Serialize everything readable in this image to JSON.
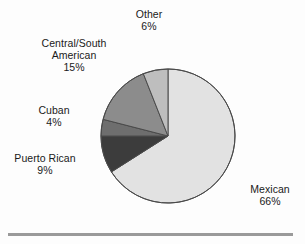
{
  "chart_data": {
    "type": "pie",
    "title": "",
    "subtitle": "",
    "xlabel": "",
    "ylabel": "",
    "legend_position": "none",
    "grid": false,
    "units": "percent",
    "start_angle_deg": 0,
    "direction": "clockwise",
    "categories": [
      "Mexican",
      "Puerto Rican",
      "Cuban",
      "Central/South American",
      "Other"
    ],
    "values": [
      66,
      9,
      4,
      15,
      6
    ],
    "slices": [
      {
        "label": "Mexican",
        "label_line1": "Mexican",
        "value": 66,
        "value_text": "66%",
        "color": "#e2e2e2",
        "label_position": "right"
      },
      {
        "label": "Puerto Rican",
        "label_line1": "Puerto Rican",
        "value": 9,
        "value_text": "9%",
        "color": "#3c3c3c",
        "label_position": "left"
      },
      {
        "label": "Cuban",
        "label_line1": "Cuban",
        "value": 4,
        "value_text": "4%",
        "color": "#6e6e6e",
        "label_position": "left"
      },
      {
        "label": "Central/South American",
        "label_line1": "Central/South",
        "label_line2": "American",
        "value": 15,
        "value_text": "15%",
        "color": "#8c8c8c",
        "label_position": "upper-left"
      },
      {
        "label": "Other",
        "label_line1": "Other",
        "value": 6,
        "value_text": "6%",
        "color": "#bebebe",
        "label_position": "top"
      }
    ],
    "total": 100,
    "outline_color": "#4a4a4a",
    "rule_color": "#9a9a9a"
  }
}
